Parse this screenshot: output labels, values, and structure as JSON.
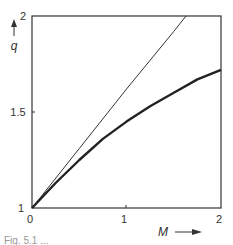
{
  "chart_data": {
    "type": "line",
    "title": "",
    "xlabel": "M",
    "ylabel": "q",
    "xlim": [
      0,
      2
    ],
    "ylim": [
      1,
      2
    ],
    "x_ticks": [
      "0",
      "1",
      "2"
    ],
    "y_ticks": [
      "1",
      "1.5",
      "2"
    ],
    "grid": false,
    "legend": null,
    "series": [
      {
        "name": "thin straight line",
        "style": "thin",
        "x": [
          0,
          0.5,
          1.0,
          1.5,
          1.63
        ],
        "y": [
          1.0,
          1.31,
          1.62,
          1.92,
          2.0
        ]
      },
      {
        "name": "thick curve",
        "style": "thick",
        "x": [
          0,
          0.25,
          0.5,
          0.75,
          1.0,
          1.25,
          1.5,
          1.75,
          2.0
        ],
        "y": [
          1.0,
          1.13,
          1.25,
          1.36,
          1.45,
          1.53,
          1.6,
          1.67,
          1.72
        ]
      }
    ]
  },
  "axes": {
    "x_label": "M",
    "y_label": "q",
    "x_tick_0": "0",
    "x_tick_1": "1",
    "x_tick_2": "2",
    "y_tick_1": "1",
    "y_tick_15": "1.5",
    "y_tick_2": "2"
  },
  "caption": "Fig. 5.1  ..."
}
